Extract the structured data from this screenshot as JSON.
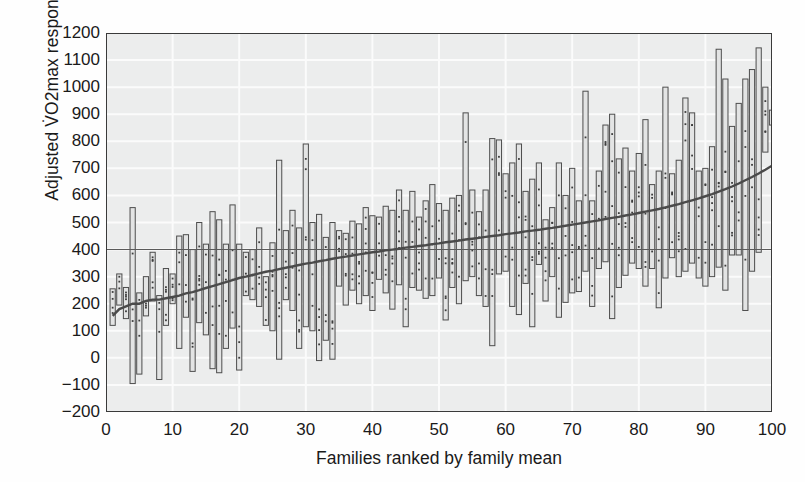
{
  "figure": {
    "width": 805,
    "height": 482,
    "background": "#fefefe",
    "plot_background": "#eceded",
    "grid_color": "#fbfbfb",
    "axis_color": "#3a3a3a",
    "bar_stroke": "#4d4d4d",
    "bar_fill": "#e3e4e4",
    "dot_color": "#3d3d3d",
    "trend_color": "#4a4a4a",
    "reference_color": "#5a5a5a"
  },
  "chart_data": {
    "type": "bar",
    "title": "",
    "xlabel": "Families ranked by family mean",
    "ylabel": "Adjusted V̇O2max response",
    "ylabel_parts": {
      "prefix": "Adjusted V",
      "dot": "̇",
      "symbol": "O",
      "sub": "2",
      "suffix": "max response"
    },
    "xlim": [
      0,
      100
    ],
    "ylim": [
      -200,
      1200
    ],
    "xticks": [
      0,
      10,
      20,
      30,
      40,
      50,
      60,
      70,
      80,
      90,
      100
    ],
    "xtick_labels": [
      "0",
      "10",
      "20",
      "30",
      "40",
      "50",
      "60",
      "70",
      "80",
      "90",
      "100"
    ],
    "yticks": [
      -200,
      -100,
      0,
      100,
      200,
      300,
      400,
      500,
      600,
      700,
      800,
      900,
      1000,
      1100,
      1200
    ],
    "ytick_labels": [
      "−200",
      "−100",
      "0",
      "100",
      "200",
      "300",
      "400",
      "500",
      "600",
      "700",
      "800",
      "900",
      "1000",
      "1100",
      "1200"
    ],
    "grid": true,
    "legend": "none",
    "reference_line": {
      "y": 400,
      "label": ""
    },
    "series_description": "Each vertical bar spans the minimum to maximum adjusted VO2max response within one family; dots mark individual family members; the rising dark line is the family mean ordered by rank.",
    "categories": [
      1,
      2,
      3,
      4,
      5,
      6,
      7,
      8,
      9,
      10,
      11,
      12,
      13,
      14,
      15,
      16,
      17,
      18,
      19,
      20,
      21,
      22,
      23,
      24,
      25,
      26,
      27,
      28,
      29,
      30,
      31,
      32,
      33,
      34,
      35,
      36,
      37,
      38,
      39,
      40,
      41,
      42,
      43,
      44,
      45,
      46,
      47,
      48,
      49,
      50,
      51,
      52,
      53,
      54,
      55,
      56,
      57,
      58,
      59,
      60,
      61,
      62,
      63,
      64,
      65,
      66,
      67,
      68,
      69,
      70,
      71,
      72,
      73,
      74,
      75,
      76,
      77,
      78,
      79,
      80,
      81,
      82,
      83,
      84,
      85,
      86,
      87,
      88,
      89,
      90,
      91,
      92,
      93,
      94,
      95,
      96,
      97,
      98,
      99,
      100
    ],
    "series": [
      {
        "name": "family_min",
        "values": [
          120,
          195,
          145,
          -95,
          -60,
          155,
          210,
          -80,
          120,
          200,
          35,
          150,
          -50,
          130,
          85,
          -40,
          -55,
          35,
          110,
          -45,
          230,
          215,
          190,
          120,
          100,
          -5,
          215,
          175,
          35,
          115,
          100,
          -10,
          65,
          -5,
          265,
          195,
          250,
          200,
          230,
          175,
          290,
          240,
          180,
          270,
          115,
          260,
          250,
          220,
          230,
          295,
          140,
          260,
          200,
          285,
          300,
          230,
          190,
          45,
          310,
          320,
          190,
          160,
          275,
          115,
          345,
          210,
          300,
          150,
          205,
          240,
          245,
          320,
          190,
          330,
          355,
          145,
          260,
          305,
          350,
          330,
          265,
          330,
          185,
          295,
          370,
          300,
          320,
          350,
          295,
          265,
          300,
          335,
          250,
          380,
          380,
          175,
          320,
          390,
          760,
          860
        ]
      },
      {
        "name": "family_max",
        "values": [
          255,
          310,
          260,
          555,
          240,
          300,
          390,
          230,
          330,
          310,
          450,
          455,
          400,
          500,
          420,
          540,
          510,
          420,
          565,
          420,
          390,
          400,
          480,
          300,
          425,
          730,
          470,
          545,
          480,
          790,
          500,
          530,
          445,
          500,
          470,
          460,
          505,
          495,
          555,
          525,
          520,
          560,
          545,
          620,
          545,
          615,
          520,
          580,
          640,
          570,
          545,
          590,
          600,
          905,
          620,
          540,
          620,
          810,
          805,
          680,
          720,
          790,
          615,
          660,
          720,
          510,
          555,
          720,
          600,
          700,
          580,
          985,
          580,
          690,
          860,
          900,
          735,
          775,
          690,
          755,
          880,
          640,
          690,
          1000,
          680,
          730,
          960,
          905,
          690,
          700,
          780,
          1140,
          1030,
          855,
          940,
          1030,
          1065,
          1145,
          1000,
          915
        ]
      },
      {
        "name": "family_mean",
        "values": [
          155,
          180,
          190,
          200,
          200,
          210,
          215,
          215,
          220,
          225,
          230,
          238,
          243,
          250,
          258,
          265,
          272,
          280,
          287,
          295,
          300,
          306,
          312,
          318,
          322,
          328,
          333,
          338,
          343,
          348,
          352,
          357,
          361,
          366,
          370,
          374,
          378,
          382,
          386,
          390,
          393,
          397,
          400,
          403,
          407,
          410,
          413,
          416,
          420,
          423,
          427,
          430,
          433,
          437,
          440,
          443,
          447,
          450,
          453,
          457,
          460,
          463,
          467,
          470,
          473,
          477,
          480,
          484,
          488,
          492,
          496,
          500,
          504,
          508,
          513,
          517,
          521,
          526,
          530,
          535,
          540,
          545,
          550,
          556,
          562,
          568,
          575,
          582,
          589,
          597,
          605,
          614,
          623,
          633,
          644,
          656,
          668,
          681,
          695,
          710
        ]
      }
    ]
  }
}
